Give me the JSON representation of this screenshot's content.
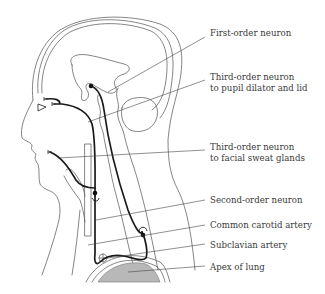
{
  "figure": {
    "colors": {
      "outline": "#555555",
      "neuron": "#1a1a1a",
      "lung_fill": "#b8b8b8",
      "label_text": "#3a3a3a",
      "leader_line": "#444444"
    }
  },
  "labels": [
    {
      "id": "first-order-neuron",
      "lines": [
        "First-order neuron"
      ],
      "x": 210,
      "y": 32
    },
    {
      "id": "third-order-neuron-pupil",
      "lines": [
        "Third-order neuron",
        "to pupil dilator and lid"
      ],
      "x": 210,
      "y": 73
    },
    {
      "id": "third-order-neuron-sweat",
      "lines": [
        "Third-order neuron",
        "to facial sweat glands"
      ],
      "x": 210,
      "y": 143
    },
    {
      "id": "second-order-neuron",
      "lines": [
        "Second-order neuron"
      ],
      "x": 210,
      "y": 196
    },
    {
      "id": "common-carotid-artery",
      "lines": [
        "Common carotid artery"
      ],
      "x": 210,
      "y": 220
    },
    {
      "id": "subclavian-artery",
      "lines": [
        "Subclavian artery"
      ],
      "x": 210,
      "y": 240
    },
    {
      "id": "apex-of-lung",
      "lines": [
        "Apex of lung"
      ],
      "x": 210,
      "y": 262
    }
  ]
}
